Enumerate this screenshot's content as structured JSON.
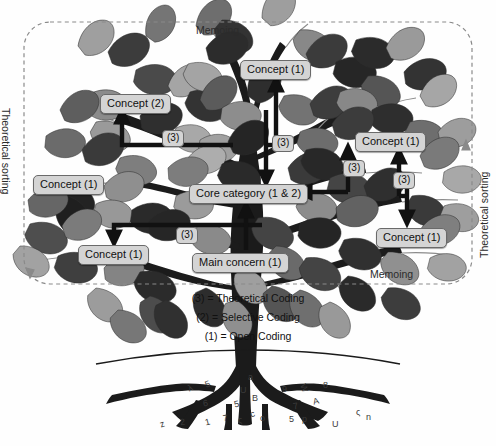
{
  "figure": {
    "title_visible": false,
    "palette": {
      "box_fill": "#d4d4d4",
      "box_stroke": "#6a6a6a",
      "arrow": "#111111",
      "dashed_border": "#8a8a8a",
      "trunk_dark": "#1b1b1b",
      "leaf_dark": "#3a3a3a",
      "leaf_mid": "#6f6f6f",
      "leaf_light": "#a9a9a9",
      "background": "#fefefe"
    }
  },
  "boundary": {
    "style": "dashed-rounded-rectangle",
    "top_label": "Memoing",
    "bottom_label": "Memoing",
    "left_label": "Theoretical sorting",
    "right_label": "Theoretical sorting"
  },
  "nodes": [
    {
      "id": "concept-top",
      "label": "Concept (1)",
      "x": 240,
      "y": 60
    },
    {
      "id": "concept-2-left",
      "label": "Concept (2)",
      "x": 100,
      "y": 94
    },
    {
      "id": "concept-left",
      "label": "Concept (1)",
      "x": 33,
      "y": 175
    },
    {
      "id": "core-category",
      "label": "Core category (1 & 2)",
      "x": 189,
      "y": 184
    },
    {
      "id": "concept-right",
      "label": "Concept (1)",
      "x": 355,
      "y": 132
    },
    {
      "id": "concept-lower-left",
      "label": "Concept (1)",
      "x": 78,
      "y": 245
    },
    {
      "id": "concept-lower-right",
      "label": "Concept (1)",
      "x": 376,
      "y": 228
    },
    {
      "id": "main-concern",
      "label": "Main concern (1)",
      "x": 192,
      "y": 253
    }
  ],
  "code_tags": [
    {
      "id": "tag-left",
      "label": "(3)",
      "x": 162,
      "y": 130
    },
    {
      "id": "tag-center",
      "label": "(3)",
      "x": 272,
      "y": 135
    },
    {
      "id": "tag-right-upper",
      "label": "(3)",
      "x": 343,
      "y": 160
    },
    {
      "id": "tag-right-lower",
      "label": "(3)",
      "x": 393,
      "y": 172
    },
    {
      "id": "tag-lower-left",
      "label": "(3)",
      "x": 176,
      "y": 227
    }
  ],
  "legend": {
    "lines": [
      "(3) = Theoretical Coding",
      "(2) = Selective Coding",
      "(1) = Open Coding"
    ]
  },
  "root_characters": [
    {
      "ch": "z",
      "x": 160,
      "y": 419,
      "rot": -18
    },
    {
      "ch": "2",
      "x": 180,
      "y": 417,
      "rot": -8
    },
    {
      "ch": "1",
      "x": 205,
      "y": 417,
      "rot": -14
    },
    {
      "ch": "7",
      "x": 223,
      "y": 413,
      "rot": -10
    },
    {
      "ch": "ς",
      "x": 238,
      "y": 415,
      "rot": 0
    },
    {
      "ch": "6",
      "x": 203,
      "y": 398,
      "rot": -10
    },
    {
      "ch": "5",
      "x": 234,
      "y": 399,
      "rot": -12
    },
    {
      "ch": "λ",
      "x": 188,
      "y": 383,
      "rot": -22
    },
    {
      "ch": "5",
      "x": 205,
      "y": 379,
      "rot": -20
    },
    {
      "ch": "a",
      "x": 248,
      "y": 372,
      "rot": 0
    },
    {
      "ch": "U",
      "x": 240,
      "y": 385,
      "rot": 0
    },
    {
      "ch": "B",
      "x": 252,
      "y": 393,
      "rot": 0
    },
    {
      "ch": "c",
      "x": 250,
      "y": 409,
      "rot": -20
    },
    {
      "ch": "o",
      "x": 260,
      "y": 413,
      "rot": -10
    },
    {
      "ch": "9",
      "x": 282,
      "y": 384,
      "rot": 0
    },
    {
      "ch": "W",
      "x": 300,
      "y": 383,
      "rot": 70
    },
    {
      "ch": "8",
      "x": 323,
      "y": 380,
      "rot": 0
    },
    {
      "ch": "7",
      "x": 293,
      "y": 401,
      "rot": -12
    },
    {
      "ch": "A",
      "x": 313,
      "y": 396,
      "rot": -14
    },
    {
      "ch": "5",
      "x": 289,
      "y": 414,
      "rot": 0
    },
    {
      "ch": "p",
      "x": 302,
      "y": 414,
      "rot": 0
    },
    {
      "ch": "U",
      "x": 332,
      "y": 419,
      "rot": 0
    },
    {
      "ch": "ς",
      "x": 356,
      "y": 407,
      "rot": 0
    },
    {
      "ch": "n",
      "x": 366,
      "y": 412,
      "rot": 0
    }
  ]
}
